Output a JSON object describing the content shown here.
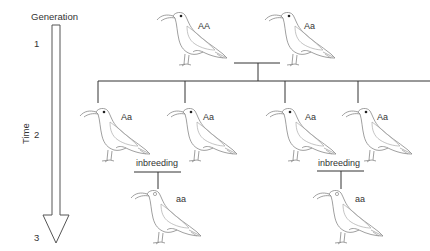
{
  "axis": {
    "title": "Generation",
    "time_label": "Time",
    "generations": [
      "1",
      "2",
      "3"
    ]
  },
  "birds": {
    "gen1_left": {
      "genotype": "AA",
      "eye": "filled"
    },
    "gen1_right": {
      "genotype": "Aa",
      "eye": "filled"
    },
    "gen2_a": {
      "genotype": "Aa",
      "eye": "filled"
    },
    "gen2_b": {
      "genotype": "Aa",
      "eye": "filled"
    },
    "gen2_c": {
      "genotype": "Aa",
      "eye": "filled"
    },
    "gen2_d": {
      "genotype": "Aa",
      "eye": "filled"
    },
    "gen3_left": {
      "genotype": "aa",
      "eye": "open"
    },
    "gen3_right": {
      "genotype": "aa",
      "eye": "open"
    }
  },
  "crosses": {
    "left_label": "inbreeding",
    "right_label": "inbreeding"
  },
  "colors": {
    "line": "#333333",
    "bird_stroke": "#888888",
    "arrow_stroke": "#555555"
  }
}
